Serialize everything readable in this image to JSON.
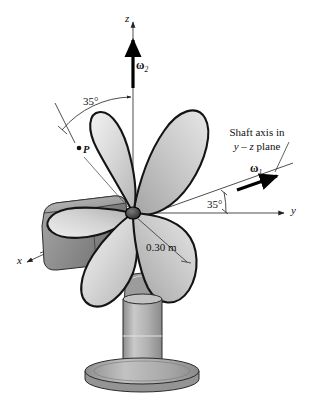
{
  "figure": {
    "name": "electric-fan-rigid-body-kinematics-diagram",
    "background_color": "#ffffff",
    "line_color": "#111111",
    "width": 311,
    "height": 403
  },
  "axes": {
    "z": {
      "label": "z",
      "direction": "vertical-up"
    },
    "y": {
      "label": "y",
      "direction": "horizontal-right"
    },
    "x": {
      "label": "x",
      "direction": "lower-left-oblique"
    }
  },
  "vectors": {
    "omega1": {
      "label": "ω",
      "subscript": "1",
      "description": "spin about shaft axis"
    },
    "omega2": {
      "label": "ω",
      "subscript": "2",
      "description": "precession about vertical z axis"
    }
  },
  "annotations": {
    "angle_top": "35°",
    "angle_bottom": "35°",
    "radius": "0.30 m",
    "point_p": "P",
    "shaft_note_line1": "Shaft axis in",
    "shaft_note_line2_pre": "y",
    "shaft_note_line2_dash": " – ",
    "shaft_note_line2_mid": "z",
    "shaft_note_line2_post": " plane"
  },
  "colors": {
    "outline": "#111111",
    "blade_light": "#e8e8e8",
    "blade_mid": "#c8c8c8",
    "blade_dark": "#a8a8a8",
    "housing": "#8f8f8f",
    "post": "#b0b0b0",
    "base": "#9a9a9a",
    "axis_line": "#3a3a3a"
  }
}
